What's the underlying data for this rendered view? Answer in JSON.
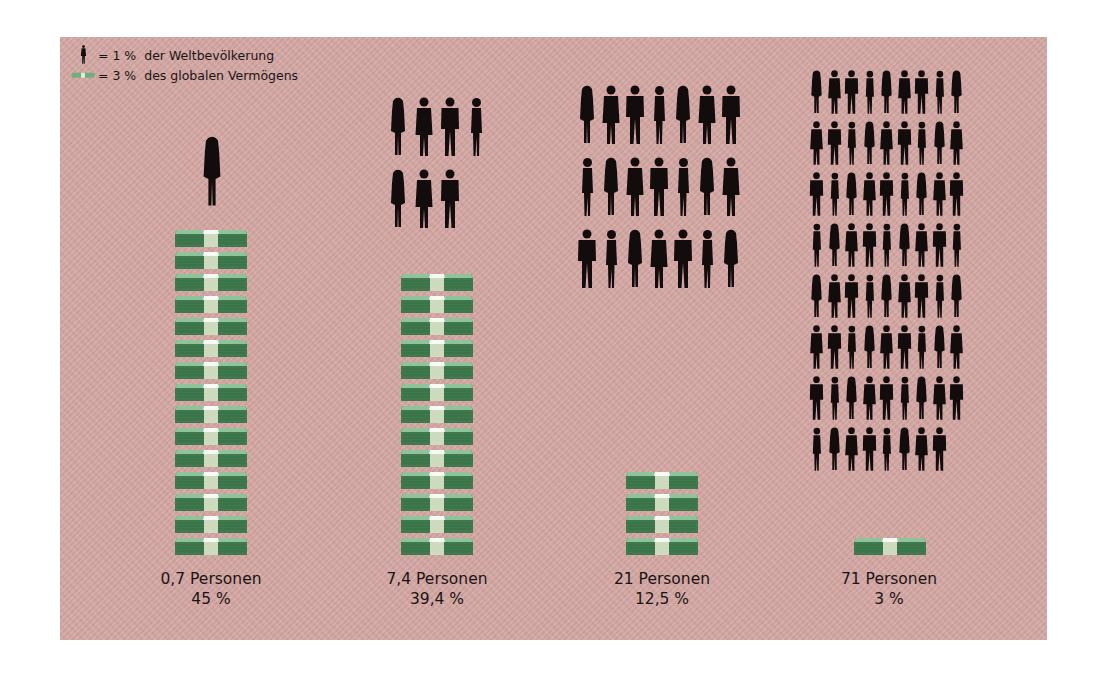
{
  "legend": {
    "person": {
      "icon": "person-icon",
      "text": "= 1 %  der Weltbevölkerung"
    },
    "money": {
      "icon": "money-bundle-icon",
      "text": "= 3 %  des globalen Vermögens"
    }
  },
  "colors": {
    "background": "#d3a6a2",
    "person": "#120c0c",
    "money_dark": "#3f7a4e",
    "money_light": "#8fc49a",
    "band": "#e9ecd2",
    "text": "#1c1414"
  },
  "columns": [
    {
      "persons_label": "0,7 Personen",
      "share_label": "45 %",
      "people_icons": 1,
      "money_bundles": 15
    },
    {
      "persons_label": "7,4 Personen",
      "share_label": "39,4 %",
      "people_icons": 7,
      "money_bundles": 13
    },
    {
      "persons_label": "21 Personen",
      "share_label": "12,5 %",
      "people_icons": 21,
      "money_bundles": 4
    },
    {
      "persons_label": "71 Personen",
      "share_label": "3 %",
      "people_icons": 71,
      "money_bundles": 1
    }
  ],
  "chart_data": {
    "type": "bar",
    "title": "",
    "subtitle": "",
    "xlabel": "",
    "ylabel": "",
    "legend": [
      "1 person icon = 1 % der Weltbevölkerung",
      "1 money bundle = 3 % des globalen Vermögens"
    ],
    "categories": [
      "0,7 Personen",
      "7,4 Personen",
      "21 Personen",
      "71 Personen"
    ],
    "series": [
      {
        "name": "Anteil am globalen Vermögen (%)",
        "values": [
          45,
          39.4,
          12.5,
          3
        ]
      },
      {
        "name": "Anteil an der Weltbevölkerung (%)",
        "values": [
          0.7,
          7.4,
          21,
          71
        ]
      }
    ],
    "pictogram_counts": {
      "money_bundles": [
        15,
        13,
        4,
        1
      ],
      "people_icons": [
        1,
        7,
        21,
        71
      ]
    },
    "value_labels": [
      "45 %",
      "39,4 %",
      "12,5 %",
      "3 %"
    ],
    "grid": false,
    "legend_position": "top-left"
  }
}
